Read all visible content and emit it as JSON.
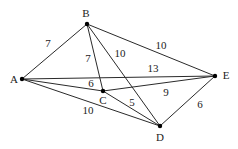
{
  "diagram": {
    "type": "weighted-undirected-graph",
    "nodes": [
      {
        "id": "A",
        "label": "A",
        "x": 22,
        "y": 79,
        "label_x": 14,
        "label_y": 80
      },
      {
        "id": "B",
        "label": "B",
        "x": 87,
        "y": 24,
        "label_x": 86,
        "label_y": 14
      },
      {
        "id": "C",
        "label": "C",
        "x": 103,
        "y": 91,
        "label_x": 103,
        "label_y": 101
      },
      {
        "id": "D",
        "label": "D",
        "x": 160,
        "y": 126,
        "label_x": 160,
        "label_y": 138
      },
      {
        "id": "E",
        "label": "E",
        "x": 215,
        "y": 76,
        "label_x": 226,
        "label_y": 76
      }
    ],
    "edges": [
      {
        "from": "A",
        "to": "B",
        "weight": "7",
        "label_x": 48,
        "label_y": 44
      },
      {
        "from": "B",
        "to": "C",
        "weight": "7",
        "label_x": 88,
        "label_y": 59
      },
      {
        "from": "B",
        "to": "D",
        "weight": "10",
        "label_x": 120,
        "label_y": 54
      },
      {
        "from": "B",
        "to": "E",
        "weight": "10",
        "label_x": 161,
        "label_y": 46
      },
      {
        "from": "A",
        "to": "E",
        "weight": "13",
        "label_x": 153,
        "label_y": 69
      },
      {
        "from": "A",
        "to": "C",
        "weight": "6",
        "label_x": 91,
        "label_y": 84
      },
      {
        "from": "C",
        "to": "E",
        "weight": "9",
        "label_x": 166,
        "label_y": 93
      },
      {
        "from": "C",
        "to": "D",
        "weight": "5",
        "label_x": 132,
        "label_y": 103
      },
      {
        "from": "A",
        "to": "D",
        "weight": "10",
        "label_x": 88,
        "label_y": 111
      },
      {
        "from": "D",
        "to": "E",
        "weight": "6",
        "label_x": 200,
        "label_y": 105
      }
    ]
  }
}
